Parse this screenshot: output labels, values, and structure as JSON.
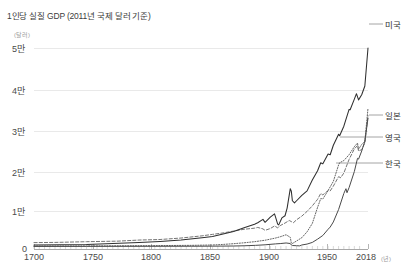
{
  "title": "1인당 실질 GDP (2011년 국제 달러 기준)",
  "axes": {
    "y_unit": "(달러)",
    "x_unit": "(년)",
    "y_ticks": [
      "5만",
      "4만",
      "3만",
      "2만",
      "1만",
      "0"
    ],
    "x_ticks": [
      "1700",
      "1750",
      "1800",
      "1850",
      "1900",
      "1950",
      "2018"
    ]
  },
  "series_labels": {
    "us": "미국",
    "jp": "일본",
    "uk": "영국",
    "kr": "한국"
  },
  "colors": {
    "us_line": "#2f2f2f",
    "jp_line": "#5e5e5e",
    "uk_line": "#6d6d6d",
    "kr_line": "#4a4a4a",
    "grid": "#e9e9e9",
    "axis": "#a8a8a8",
    "background": "#ffffff"
  },
  "chart_data": {
    "type": "line",
    "title": "1인당 실질 GDP (2011년 국제 달러 기준)",
    "xlabel": "(년)",
    "ylabel": "(달러)",
    "xlim": [
      1700,
      2018
    ],
    "ylim": [
      0,
      55000
    ],
    "yticks": [
      0,
      10000,
      20000,
      30000,
      40000,
      50000
    ],
    "ytick_labels": [
      "0",
      "1만",
      "2만",
      "3만",
      "4만",
      "5만"
    ],
    "xticks": [
      1700,
      1750,
      1800,
      1850,
      1900,
      1950,
      2018
    ],
    "grid": true,
    "legend_position": "right-inline-labels",
    "series": [
      {
        "name": "미국",
        "style": "solid",
        "x": [
          1700,
          1750,
          1800,
          1820,
          1840,
          1860,
          1870,
          1880,
          1890,
          1900,
          1910,
          1913,
          1918,
          1920,
          1925,
          1929,
          1930,
          1932,
          1933,
          1936,
          1939,
          1941,
          1944,
          1945,
          1946,
          1948,
          1950,
          1955,
          1960,
          1965,
          1970,
          1973,
          1975,
          1980,
          1982,
          1985,
          1990,
          1991,
          1995,
          2000,
          2001,
          2005,
          2007,
          2009,
          2012,
          2015,
          2018
        ],
        "y": [
          1100,
          1250,
          1750,
          2050,
          2450,
          3100,
          3400,
          4100,
          4800,
          5800,
          6800,
          7200,
          8100,
          7300,
          8700,
          9600,
          8700,
          6800,
          6600,
          8500,
          9100,
          11200,
          16500,
          15800,
          13200,
          12600,
          13200,
          14700,
          15900,
          18900,
          21400,
          23600,
          23300,
          26000,
          25800,
          28400,
          31400,
          31000,
          33600,
          38200,
          38100,
          41000,
          42500,
          40800,
          42200,
          44600,
          55000
        ]
      },
      {
        "name": "일본",
        "style": "dotted",
        "x": [
          1700,
          1750,
          1800,
          1850,
          1870,
          1880,
          1890,
          1900,
          1910,
          1920,
          1930,
          1935,
          1940,
          1944,
          1945,
          1946,
          1950,
          1955,
          1960,
          1965,
          1970,
          1973,
          1975,
          1980,
          1985,
          1990,
          1991,
          1995,
          2000,
          2005,
          2008,
          2009,
          2012,
          2015,
          2018
        ],
        "y": [
          800,
          850,
          900,
          1000,
          1100,
          1250,
          1450,
          1700,
          2000,
          2400,
          3000,
          3400,
          3900,
          3200,
          1600,
          1500,
          2200,
          3100,
          4700,
          7000,
          11400,
          13800,
          13700,
          16000,
          18500,
          23000,
          23600,
          24200,
          25800,
          28000,
          29000,
          27300,
          28600,
          29500,
          38500
        ]
      },
      {
        "name": "영국",
        "style": "dashed",
        "x": [
          1700,
          1720,
          1750,
          1780,
          1800,
          1820,
          1840,
          1860,
          1870,
          1880,
          1890,
          1900,
          1910,
          1913,
          1918,
          1920,
          1925,
          1929,
          1932,
          1935,
          1939,
          1943,
          1945,
          1947,
          1950,
          1955,
          1960,
          1965,
          1970,
          1973,
          1975,
          1980,
          1982,
          1985,
          1990,
          1992,
          1995,
          2000,
          2005,
          2008,
          2009,
          2012,
          2015,
          2018
        ],
        "y": [
          1750,
          1800,
          2000,
          2150,
          2450,
          2600,
          3000,
          3600,
          4000,
          4400,
          4900,
          5400,
          5700,
          5900,
          5500,
          5100,
          5600,
          6300,
          5800,
          6500,
          7100,
          7800,
          7500,
          7200,
          8000,
          9000,
          10300,
          11800,
          13600,
          15200,
          14800,
          16000,
          15900,
          17200,
          19800,
          19500,
          20800,
          24500,
          27400,
          28300,
          26800,
          27200,
          29000,
          36500
        ]
      },
      {
        "name": "한국",
        "style": "solid-thin",
        "x": [
          1700,
          1750,
          1800,
          1850,
          1870,
          1890,
          1900,
          1911,
          1920,
          1930,
          1935,
          1940,
          1944,
          1945,
          1946,
          1950,
          1953,
          1955,
          1960,
          1965,
          1970,
          1975,
          1980,
          1982,
          1985,
          1990,
          1995,
          1997,
          1998,
          2000,
          2005,
          2008,
          2009,
          2012,
          2015,
          2018
        ],
        "y": [
          700,
          720,
          740,
          760,
          780,
          820,
          880,
          1000,
          1150,
          1400,
          1500,
          1650,
          1500,
          1100,
          950,
          900,
          850,
          1100,
          1350,
          1800,
          2700,
          3700,
          5400,
          6000,
          7400,
          10800,
          15200,
          16500,
          15400,
          16800,
          21200,
          24800,
          24600,
          26800,
          29500,
          35800
        ]
      }
    ]
  }
}
